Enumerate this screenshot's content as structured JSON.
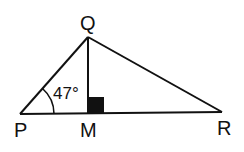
{
  "diagram": {
    "type": "geometry-triangle",
    "points": {
      "P": {
        "label": "P",
        "x": 20,
        "y": 114
      },
      "Q": {
        "label": "Q",
        "x": 88,
        "y": 37
      },
      "M": {
        "label": "M",
        "x": 88,
        "y": 114
      },
      "R": {
        "label": "R",
        "x": 222,
        "y": 112
      }
    },
    "segments": [
      "PQ",
      "QR",
      "PR",
      "QM"
    ],
    "right_angle_at": "M",
    "angle": {
      "vertex": "P",
      "value": "47°"
    },
    "colors": {
      "stroke": "#111111",
      "background": "#ffffff"
    }
  }
}
